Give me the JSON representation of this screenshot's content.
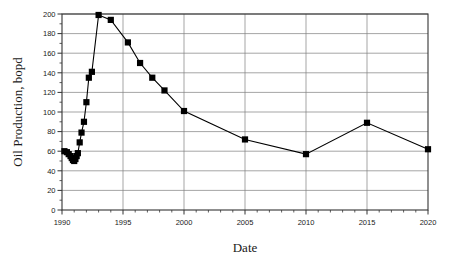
{
  "chart_data": {
    "type": "line",
    "title": "",
    "xlabel": "Date",
    "ylabel": "Oil Production, bopd",
    "xlim": [
      1990,
      2020
    ],
    "ylim": [
      0,
      200
    ],
    "xticks": [
      1990,
      1995,
      2000,
      2005,
      2010,
      2015,
      2020
    ],
    "xtick_labels": [
      "1990",
      "1995",
      "2000",
      "2005",
      "2010",
      "2015",
      "2020"
    ],
    "x_minor_step": 1,
    "yticks": [
      0,
      20,
      40,
      60,
      80,
      100,
      120,
      140,
      160,
      180,
      200
    ],
    "ytick_labels": [
      "0",
      "20",
      "40",
      "60",
      "80",
      "100",
      "120",
      "140",
      "160",
      "180",
      "200"
    ],
    "y_minor_step": 10,
    "grid": true,
    "grid_color": "#808080",
    "legend": "none",
    "marker": "square",
    "marker_color": "#000000",
    "line_color": "#000000",
    "series": [
      {
        "name": "Oil Production",
        "x": [
          1990.2,
          1990.4,
          1990.55,
          1990.7,
          1990.8,
          1990.9,
          1991.0,
          1991.1,
          1991.2,
          1991.3,
          1991.45,
          1991.6,
          1991.8,
          1992.0,
          1992.2,
          1992.45,
          1993.0,
          1994.0,
          1995.4,
          1996.4,
          1997.4,
          1998.4,
          2000.0,
          2005.0,
          2010.0,
          2015.0,
          2020.0
        ],
        "y": [
          60,
          59,
          57,
          55,
          53,
          51,
          50,
          52,
          55,
          58,
          69,
          79,
          90,
          110,
          135,
          141,
          199,
          194,
          171,
          150,
          135,
          122,
          101,
          72,
          57,
          89,
          62
        ]
      }
    ]
  },
  "axis_labels": {
    "y": "Oil Production, bopd",
    "x": "Date"
  }
}
